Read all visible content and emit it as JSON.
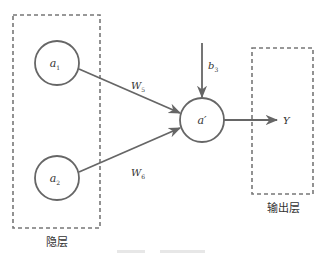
{
  "diagram": {
    "type": "neural-network-neuron",
    "colors": {
      "stroke": "#666666",
      "text": "#333333",
      "background": "#ffffff"
    },
    "groups": {
      "hidden_layer": {
        "label": "隐层"
      },
      "output_layer": {
        "label": "输出层"
      }
    },
    "nodes": {
      "a1": {
        "label": "a",
        "subscript": "1"
      },
      "a2": {
        "label": "a",
        "subscript": "2"
      },
      "a_prime": {
        "label": "a′"
      }
    },
    "edges": {
      "w5": {
        "label": "W",
        "subscript": "5",
        "from": "a1",
        "to": "a_prime"
      },
      "w6": {
        "label": "W",
        "subscript": "6",
        "from": "a2",
        "to": "a_prime"
      },
      "bias": {
        "label": "b",
        "subscript": "3",
        "to": "a_prime"
      },
      "output": {
        "label": "Y",
        "from": "a_prime"
      }
    }
  }
}
